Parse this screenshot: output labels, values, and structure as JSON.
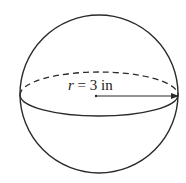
{
  "diagram": {
    "type": "sphere",
    "label": {
      "variable": "r",
      "equals": " = ",
      "value": "3",
      "unit": " in"
    },
    "colors": {
      "stroke": "#2a2a2a",
      "background": "#ffffff"
    }
  }
}
